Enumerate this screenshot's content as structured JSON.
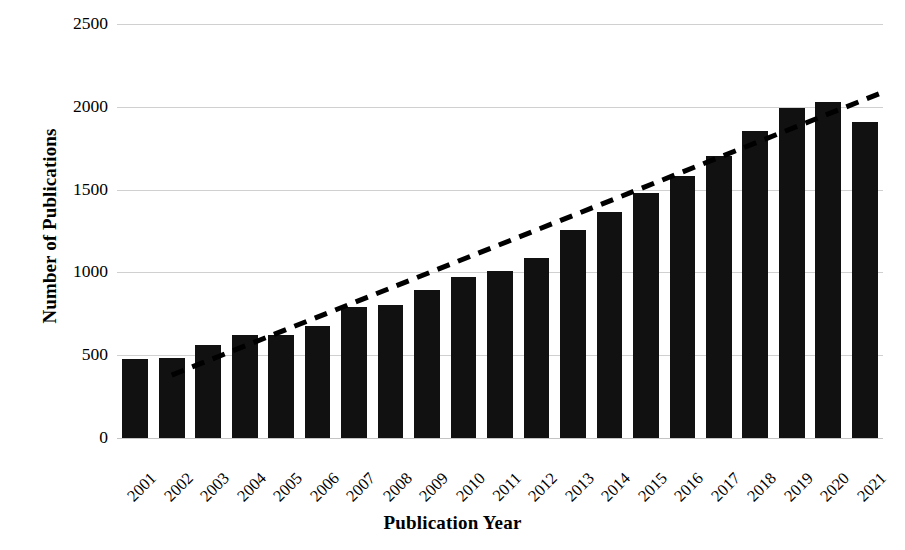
{
  "chart_data": {
    "type": "bar",
    "title": "",
    "xlabel": "Publication Year",
    "ylabel": "Number of Publications",
    "categories": [
      "2001",
      "2002",
      "2003",
      "2004",
      "2005",
      "2006",
      "2007",
      "2008",
      "2009",
      "2010",
      "2011",
      "2012",
      "2013",
      "2014",
      "2015",
      "2016",
      "2017",
      "2018",
      "2019",
      "2020",
      "2021"
    ],
    "values": [
      475,
      485,
      560,
      620,
      625,
      675,
      790,
      805,
      895,
      975,
      1010,
      1090,
      1255,
      1365,
      1480,
      1580,
      1705,
      1855,
      1990,
      2030,
      1910
    ],
    "series": [
      {
        "name": "Number of Publications",
        "type": "bar",
        "color": "#111111",
        "values": [
          475,
          485,
          560,
          620,
          625,
          675,
          790,
          805,
          895,
          975,
          1010,
          1090,
          1255,
          1365,
          1480,
          1580,
          1705,
          1855,
          1990,
          2030,
          1910
        ]
      },
      {
        "name": "Linear trendline",
        "type": "line",
        "style": "dashed",
        "color": "#000000",
        "start": {
          "x": "2002",
          "y": 380
        },
        "end": {
          "x": "2021",
          "y": 2085
        }
      }
    ],
    "ylim": [
      0,
      2500
    ],
    "yticks": [
      0,
      500,
      1000,
      1500,
      2000,
      2500
    ],
    "ytick_labels": [
      "0",
      "500",
      "1000",
      "1500",
      "2000",
      "2500"
    ],
    "grid": "horizontal",
    "legend": "none"
  },
  "axes": {
    "y_title": "Number of Publications",
    "x_title": "Publication Year"
  }
}
